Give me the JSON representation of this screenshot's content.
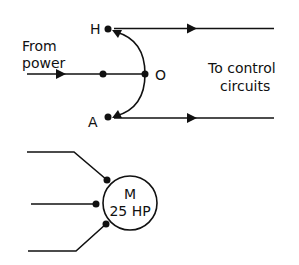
{
  "switch": {
    "terminal_h": "H",
    "terminal_o": "O",
    "terminal_a": "A",
    "input_label_line1": "From",
    "input_label_line2": "power",
    "output_label_line1": "To control",
    "output_label_line2": "circuits"
  },
  "motor": {
    "symbol": "M",
    "rating": "25 HP"
  },
  "colors": {
    "line": "#111111",
    "background": "#ffffff"
  }
}
